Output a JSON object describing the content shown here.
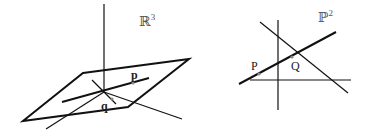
{
  "diagram": {
    "left_panel": {
      "space_label": "ℝ",
      "space_exponent": "3",
      "point_labels": {
        "p": "p",
        "q": "q"
      }
    },
    "right_panel": {
      "space_label": "ℙ",
      "space_exponent": "2",
      "point_labels": {
        "P": "P",
        "Q": "Q"
      }
    },
    "colors": {
      "line": "#111111",
      "point": "#888888",
      "space_label": "#555555"
    }
  }
}
